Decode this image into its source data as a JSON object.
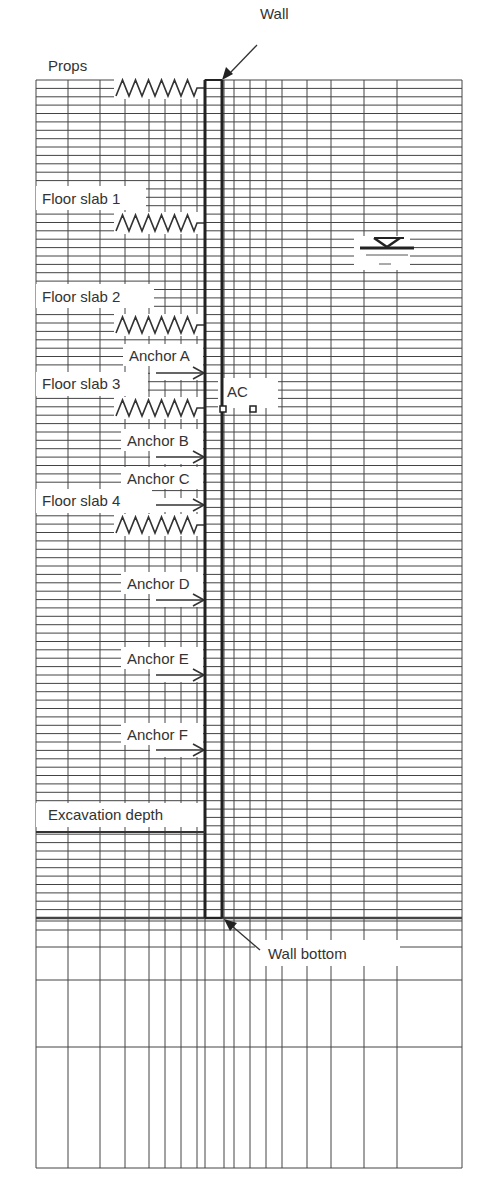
{
  "diagram": {
    "title": "",
    "colors": {
      "grid": "#444444",
      "wall": "#222222",
      "background": "#ffffff",
      "text": "#333333"
    },
    "labels": {
      "wall": "Wall",
      "props": "Props",
      "floor_slab_1": "Floor slab 1",
      "floor_slab_2": "Floor slab 2",
      "floor_slab_3": "Floor slab 3",
      "floor_slab_4": "Floor slab 4",
      "anchor_a": "Anchor A",
      "anchor_b": "Anchor B",
      "anchor_c": "Anchor C",
      "anchor_d": "Anchor D",
      "anchor_e": "Anchor E",
      "anchor_f": "Anchor F",
      "ac": "AC",
      "excavation_depth": "Excavation depth",
      "wall_bottom": "Wall bottom"
    },
    "mesh": {
      "x_lines": [
        36,
        68,
        100,
        125,
        149,
        165,
        181,
        197,
        205,
        224,
        234,
        250,
        266,
        282,
        307,
        331,
        364,
        397,
        462
      ],
      "fine_row_top": 80,
      "fine_row_bottom": 918,
      "fine_row_count": 101,
      "coarse_rows": [
        921,
        930,
        947,
        980,
        1047,
        1168
      ]
    },
    "wall": {
      "x_left": 205,
      "x_right": 222,
      "top": 80,
      "bottom": 918
    },
    "springs": [
      {
        "name": "props",
        "y": 88
      },
      {
        "name": "floor_slab_1",
        "y": 223
      },
      {
        "name": "floor_slab_2",
        "y": 325
      },
      {
        "name": "floor_slab_3",
        "y": 408
      },
      {
        "name": "floor_slab_4",
        "y": 525
      }
    ],
    "anchors": [
      {
        "name": "anchor_a",
        "y": 373
      },
      {
        "name": "anchor_b",
        "y": 457
      },
      {
        "name": "anchor_c",
        "y": 505
      },
      {
        "name": "anchor_d",
        "y": 600
      },
      {
        "name": "anchor_e",
        "y": 675
      },
      {
        "name": "anchor_f",
        "y": 750
      }
    ],
    "excavation_depth_y": 832,
    "water_table": {
      "x": 380,
      "y": 248
    }
  }
}
